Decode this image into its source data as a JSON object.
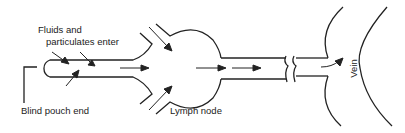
{
  "diagram": {
    "labels": {
      "fluids_line1": "Fluids and",
      "fluids_line2": "particulates enter",
      "blind_pouch": "Blind pouch end",
      "lymph_node": "Lymph node",
      "vein": "Vein"
    },
    "colors": {
      "stroke": "#222222",
      "background": "#ffffff"
    }
  }
}
